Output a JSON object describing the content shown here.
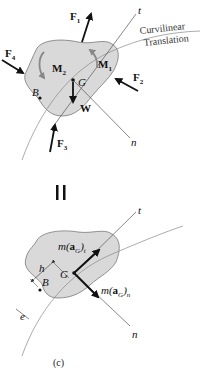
{
  "figure": {
    "caption": "(c)",
    "equals_sign": "=",
    "top_diagram": {
      "name": "free-body-diagram",
      "forces": [
        {
          "label": "F",
          "sub": "1"
        },
        {
          "label": "F",
          "sub": "2"
        },
        {
          "label": "F",
          "sub": "3"
        },
        {
          "label": "F",
          "sub": "4"
        },
        {
          "label": "W",
          "sub": ""
        }
      ],
      "moments": [
        {
          "label": "M",
          "sub": "1"
        },
        {
          "label": "M",
          "sub": "2"
        }
      ],
      "points": {
        "G": "G",
        "B": "B"
      },
      "axes": {
        "t": "t",
        "n": "n"
      },
      "path_label_line1": "Curvilinear",
      "path_label_line2": "Translation"
    },
    "bottom_diagram": {
      "name": "kinetic-diagram",
      "vectors": [
        {
          "prefix": "m(",
          "bold": "a",
          "sub": "G",
          "suffix": ")",
          "sub2": "t"
        },
        {
          "prefix": "m(",
          "bold": "a",
          "sub": "G",
          "suffix": ")",
          "sub2": "n"
        }
      ],
      "points": {
        "G": "G",
        "B": "B"
      },
      "distances": {
        "h": "h",
        "e": "e"
      },
      "axes": {
        "t": "t",
        "n": "n"
      }
    }
  }
}
